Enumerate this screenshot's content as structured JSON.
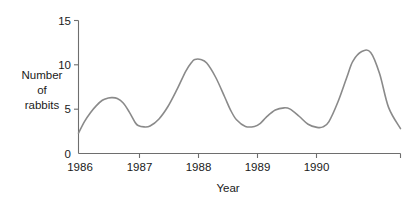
{
  "chart_data": {
    "type": "line",
    "title": "",
    "xlabel": "Year",
    "ylabel": "Number of rabbits",
    "ylabel_lines": [
      "Number",
      "of",
      "rabbits"
    ],
    "x_tick_labels": [
      "1986",
      "1987",
      "1988",
      "1989",
      "1990"
    ],
    "x_tick_values": [
      1986,
      1987,
      1988,
      1989,
      1990
    ],
    "y_tick_labels": [
      "0",
      "5",
      "10",
      "15"
    ],
    "y_tick_values": [
      0,
      5,
      10,
      15
    ],
    "xlim": [
      1986.0,
      1991.4
    ],
    "ylim": [
      0,
      15
    ],
    "grid": false,
    "legend": null,
    "series": [
      {
        "name": "Number of rabbits",
        "color": "#8a8a8a",
        "x": [
          1986.0,
          1986.1,
          1986.2,
          1986.3,
          1986.4,
          1986.5,
          1986.56,
          1986.65,
          1986.75,
          1986.85,
          1986.95,
          1987.0,
          1987.1,
          1987.2,
          1987.35,
          1987.5,
          1987.65,
          1987.8,
          1987.9,
          1987.95,
          1988.05,
          1988.15,
          1988.3,
          1988.45,
          1988.55,
          1988.65,
          1988.8,
          1988.95,
          1989.05,
          1989.15,
          1989.3,
          1989.45,
          1989.55,
          1989.7,
          1989.85,
          1990.0,
          1990.1,
          1990.2,
          1990.35,
          1990.5,
          1990.6,
          1990.75,
          1990.9,
          1991.05,
          1991.2,
          1991.4
        ],
        "y": [
          2.3,
          3.6,
          4.6,
          5.4,
          6.0,
          6.25,
          6.3,
          6.2,
          5.7,
          4.7,
          3.5,
          3.15,
          3.0,
          3.1,
          3.9,
          5.3,
          7.2,
          9.3,
          10.3,
          10.6,
          10.6,
          10.2,
          8.6,
          6.4,
          4.9,
          3.8,
          3.05,
          3.05,
          3.4,
          4.1,
          4.9,
          5.15,
          5.0,
          4.2,
          3.3,
          2.95,
          3.0,
          3.6,
          5.8,
          8.6,
          10.4,
          11.5,
          11.4,
          9.0,
          5.2,
          2.8
        ]
      }
    ],
    "data_peaks": [
      {
        "label": "peak-1",
        "x": 1986.56,
        "y": 6.3
      },
      {
        "label": "peak-2",
        "x": 1987.97,
        "y": 10.6
      },
      {
        "label": "peak-3",
        "x": 1989.45,
        "y": 5.15
      },
      {
        "label": "peak-4",
        "x": 1990.75,
        "y": 11.5
      }
    ],
    "data_troughs": [
      {
        "label": "trough-1",
        "x": 1987.1,
        "y": 3.0
      },
      {
        "label": "trough-2",
        "x": 1988.85,
        "y": 3.0
      },
      {
        "label": "trough-3",
        "x": 1990.02,
        "y": 2.95
      },
      {
        "label": "trough-4",
        "x": 1991.25,
        "y": 2.75
      }
    ],
    "axis_colors": {
      "axis": "#6e6e6e",
      "curve": "#8a8a8a",
      "text": "#1a1a1a"
    }
  }
}
